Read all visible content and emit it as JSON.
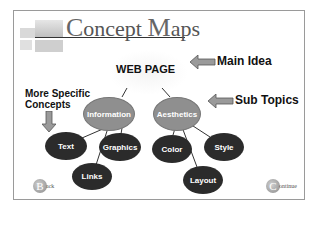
{
  "slide": {
    "title_first_cap": "C",
    "title_first_rest": "oncept ",
    "title_second_cap": "M",
    "title_second_rest": "aps"
  },
  "map": {
    "main_idea": "WEB PAGE",
    "sub_topics": [
      {
        "label": "Information",
        "children": [
          "Text",
          "Graphics",
          "Links"
        ]
      },
      {
        "label": "Aesthetics",
        "children": [
          "Color",
          "Style",
          "Layout"
        ]
      }
    ]
  },
  "annotations": {
    "main_idea": "Main Idea",
    "sub_topics": "Sub Topics",
    "more_specific_line1": "More Specific",
    "more_specific_line2": "Concepts"
  },
  "nav": {
    "back_initial": "B",
    "back_rest": "ack",
    "continue_initial": "C",
    "continue_rest": "ontinue"
  },
  "colors": {
    "sub_node": "#8f8f8f",
    "leaf_node": "#2b2b2b",
    "arrow": "#9a9a9a"
  }
}
